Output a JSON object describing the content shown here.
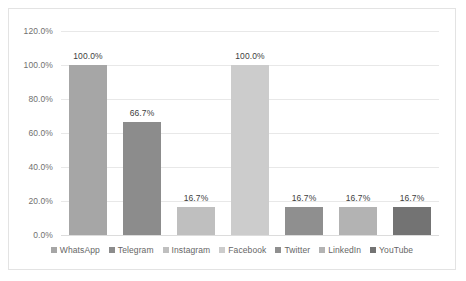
{
  "chart_data": {
    "type": "bar",
    "title": "",
    "subtitle": "",
    "xlabel": "",
    "ylabel": "",
    "ylim": [
      0,
      120
    ],
    "ytick_labels": [
      "120.0%",
      "100.0%",
      "80.0%",
      "60.0%",
      "40.0%",
      "20.0%",
      "0.0%"
    ],
    "ytick_values": [
      120,
      100,
      80,
      60,
      40,
      20,
      0
    ],
    "grid": true,
    "legend_position": "bottom",
    "categories": [
      "WhatsApp",
      "Telegram",
      "Instagram",
      "Facebook",
      "Twitter",
      "LinkedIn",
      "YouTube"
    ],
    "values": [
      100.0,
      66.7,
      16.7,
      100.0,
      16.7,
      16.7,
      16.7
    ],
    "data_labels": [
      "100.0%",
      "66.7%",
      "16.7%",
      "100.0%",
      "16.7%",
      "16.7%",
      "16.7%"
    ],
    "colors": [
      "#a6a6a6",
      "#8c8c8c",
      "#bfbfbf",
      "#cccccc",
      "#8f8f8f",
      "#b3b3b3",
      "#737373"
    ],
    "bars": [
      {
        "category": "WhatsApp",
        "value": 100.0,
        "label": "100.0%",
        "color": "#a6a6a6"
      },
      {
        "category": "Telegram",
        "value": 66.7,
        "label": "66.7%",
        "color": "#8c8c8c"
      },
      {
        "category": "Instagram",
        "value": 16.7,
        "label": "16.7%",
        "color": "#bfbfbf"
      },
      {
        "category": "Facebook",
        "value": 100.0,
        "label": "100.0%",
        "color": "#cccccc"
      },
      {
        "category": "Twitter",
        "value": 16.7,
        "label": "16.7%",
        "color": "#8f8f8f"
      },
      {
        "category": "LinkedIn",
        "value": 16.7,
        "label": "16.7%",
        "color": "#b3b3b3"
      },
      {
        "category": "YouTube",
        "value": 16.7,
        "label": "16.7%",
        "color": "#737373"
      }
    ],
    "legend": [
      {
        "label": "WhatsApp",
        "color": "#a6a6a6"
      },
      {
        "label": "Telegram",
        "color": "#8c8c8c"
      },
      {
        "label": "Instagram",
        "color": "#bfbfbf"
      },
      {
        "label": "Facebook",
        "color": "#cccccc"
      },
      {
        "label": "Twitter",
        "color": "#8f8f8f"
      },
      {
        "label": "LinkedIn",
        "color": "#b3b3b3"
      },
      {
        "label": "YouTube",
        "color": "#737373"
      }
    ]
  }
}
